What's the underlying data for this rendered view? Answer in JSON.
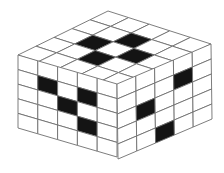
{
  "diagram": {
    "type": "isometric-cube",
    "grid_size": 5,
    "colors": {
      "filled": "#141414",
      "empty": "#ffffff",
      "line": "#6e6e6e",
      "background": "#ffffff"
    },
    "vertices": {
      "top_back": [
        108,
        11
      ],
      "top_right": [
        211,
        44
      ],
      "top_front": [
        117,
        84
      ],
      "top_left": [
        18,
        55
      ],
      "bottom_left": [
        18,
        128
      ],
      "bottom_front": [
        118,
        159
      ],
      "bottom_right": [
        211,
        116
      ]
    },
    "faces": {
      "top": {
        "label": "top-face",
        "black_cells": [
          [
            1,
            2
          ],
          [
            2,
            1
          ],
          [
            2,
            3
          ],
          [
            3,
            2
          ]
        ]
      },
      "left": {
        "label": "left-face",
        "black_cells": [
          [
            1,
            1
          ],
          [
            2,
            2
          ],
          [
            3,
            1
          ],
          [
            3,
            3
          ]
        ]
      },
      "right": {
        "label": "right-face",
        "black_cells": [
          [
            1,
            2
          ],
          [
            2,
            4
          ],
          [
            3,
            1
          ]
        ]
      }
    }
  }
}
